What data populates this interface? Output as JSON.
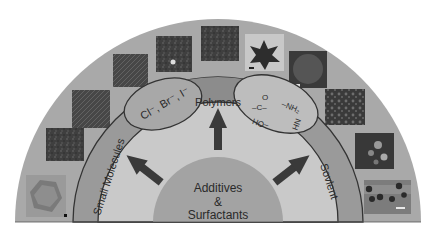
{
  "diagram": {
    "type": "semicircular-layered-schematic",
    "center_label": {
      "line1": "Additives",
      "line2": "&",
      "line3": "Surfactants"
    },
    "bands": [
      {
        "id": "small-molecules",
        "label": "Small Molecules"
      },
      {
        "id": "polymers",
        "label": "Polymers"
      },
      {
        "id": "solvent",
        "label": "Sovlent"
      }
    ],
    "sub_regions": {
      "halides": {
        "label": "Cl⁻, Br⁻, I⁻"
      },
      "functional_groups": {
        "carbonyl": "–C–",
        "carbonyl_o": "O",
        "amine": "–NH₂",
        "hydroxyl": "–OH",
        "imine": "NH"
      }
    },
    "arrows": [
      "up-left",
      "up",
      "up-right"
    ],
    "micrographs": [
      {
        "id": "img-1",
        "desc": "hexagonal crystal",
        "tone": "#8c8c8c"
      },
      {
        "id": "img-2",
        "desc": "granular aggregate",
        "tone": "#4a4a4a"
      },
      {
        "id": "img-3",
        "desc": "rod bundles",
        "tone": "#555555"
      },
      {
        "id": "img-4",
        "desc": "needle network",
        "tone": "#3e3e3e"
      },
      {
        "id": "img-5",
        "desc": "flower clusters",
        "tone": "#454545"
      },
      {
        "id": "img-6",
        "desc": "dense texture",
        "tone": "#3a3a3a"
      },
      {
        "id": "img-7",
        "desc": "star-shaped particle",
        "tone": "#c8c8c8"
      },
      {
        "id": "img-8",
        "desc": "spherical particle",
        "tone": "#4a4a4a"
      },
      {
        "id": "img-9",
        "desc": "porous texture",
        "tone": "#3c3c3c"
      },
      {
        "id": "img-10",
        "desc": "dendritic flowers",
        "tone": "#404040"
      },
      {
        "id": "img-11",
        "desc": "dots on substrate",
        "tone": "#7a7a7a"
      }
    ],
    "colors": {
      "outer": "#a9a9a9",
      "band": "#9a9a9a",
      "inner_fill": "#c9c9c9",
      "core": "#a3a3a3",
      "polymer_band": "#8f8f8f",
      "outline": "#333333",
      "arrow": "#3a3a3a"
    }
  }
}
